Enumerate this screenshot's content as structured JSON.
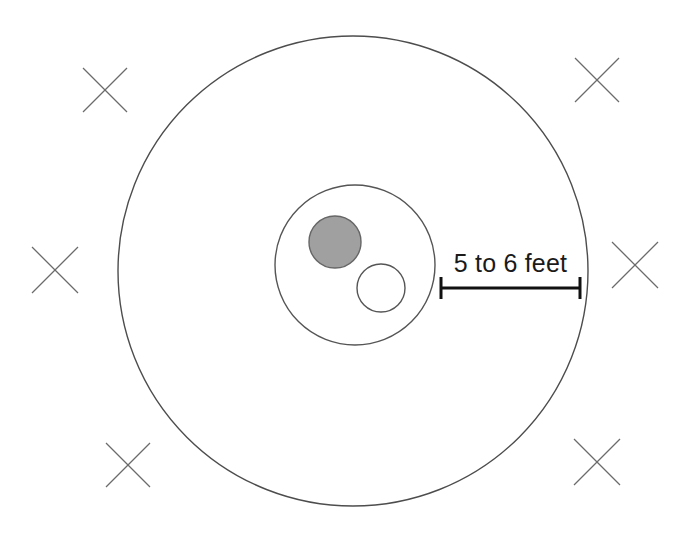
{
  "diagram": {
    "background_color": "#ffffff",
    "canvas": {
      "width": 687,
      "height": 542
    },
    "annotation": {
      "dimension_label": "5 to 6 feet",
      "label_color": "#1a1a1a",
      "dimension_line": {
        "x_start": 441,
        "x_end": 580,
        "y": 288,
        "tick_half_height": 11,
        "color": "#111111",
        "line_width": 3
      }
    },
    "shapes": {
      "outer_circle": {
        "name": "outer-clearance-circle",
        "cx": 353,
        "cy": 271,
        "r": 235,
        "stroke": "#4d4d4d",
        "stroke_width": 1.4,
        "fill": "none"
      },
      "inner_circle": {
        "name": "inner-fire-ring-circle",
        "cx": 355,
        "cy": 265,
        "r": 80,
        "stroke": "#555555",
        "stroke_width": 1.4,
        "fill": "none"
      },
      "filled_circle": {
        "name": "shaded-stone-circle",
        "cx": 335,
        "cy": 242,
        "r": 26,
        "stroke": "#666666",
        "stroke_width": 1.4,
        "fill": "#a0a0a0"
      },
      "open_circle": {
        "name": "open-stone-circle",
        "cx": 381,
        "cy": 288,
        "r": 24,
        "stroke": "#555555",
        "stroke_width": 1.4,
        "fill": "#ffffff"
      }
    },
    "x_marks": {
      "stroke": "#6b6b6b",
      "stroke_width": 1.3,
      "positions": [
        {
          "name": "x-mark-top-left",
          "cx": 105,
          "cy": 90,
          "size": 44
        },
        {
          "name": "x-mark-top-right",
          "cx": 597,
          "cy": 80,
          "size": 44
        },
        {
          "name": "x-mark-middle-left",
          "cx": 55,
          "cy": 270,
          "size": 46
        },
        {
          "name": "x-mark-middle-right",
          "cx": 635,
          "cy": 265,
          "size": 46
        },
        {
          "name": "x-mark-bottom-left",
          "cx": 128,
          "cy": 465,
          "size": 44
        },
        {
          "name": "x-mark-bottom-right",
          "cx": 597,
          "cy": 462,
          "size": 46
        }
      ]
    }
  }
}
